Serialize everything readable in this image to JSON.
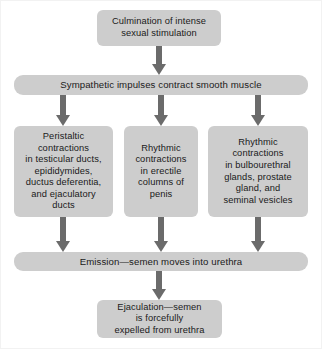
{
  "diagram": {
    "colors": {
      "box_fill": "#cdcdcd",
      "arrow": "#6b6b6b",
      "text": "#1a1a1a",
      "background": "#ffffff",
      "frame_border": "#f2f2f2"
    },
    "nodes": [
      {
        "id": "culmination",
        "label": "Culmination of intense sexual stimulation",
        "lines": [
          "Culmination of intense",
          "sexual stimulation"
        ],
        "stage": 1
      },
      {
        "id": "sympathetic",
        "label": "Sympathetic impulses contract smooth muscle",
        "lines": [
          "Sympathetic impulses contract smooth muscle"
        ],
        "stage": 2
      },
      {
        "id": "peristaltic",
        "label": "Peristaltic contractions in testicular ducts, epididymides, ductus deferentia, and ejaculatory ducts",
        "lines": [
          "Peristaltic",
          "contractions",
          "in testicular ducts,",
          "epididymides,",
          "ductus deferentia,",
          "and ejaculatory",
          "ducts"
        ],
        "stage": 3,
        "column": 1
      },
      {
        "id": "erectile",
        "label": "Rhythmic contractions in erectile columns of penis",
        "lines": [
          "Rhythmic",
          "contractions",
          "in erectile",
          "columns of",
          "penis"
        ],
        "stage": 3,
        "column": 2
      },
      {
        "id": "bulbourethral",
        "label": "Rhythmic contractions in bulbourethral glands, prostate gland, and seminal vesicles",
        "lines": [
          "Rhythmic",
          "contractions",
          "in bulbourethral",
          "glands, prostate",
          "gland, and",
          "seminal vesicles"
        ],
        "stage": 3,
        "column": 3
      },
      {
        "id": "emission",
        "label": "Emission—semen moves into urethra",
        "lines": [
          "Emission—semen moves into urethra"
        ],
        "stage": 4
      },
      {
        "id": "ejaculation",
        "label": "Ejaculation—semen is forcefully expelled from urethra",
        "lines": [
          "Ejaculation—semen",
          "is forcefully",
          "expelled from urethra"
        ],
        "stage": 5
      }
    ],
    "edges": [
      {
        "id": "culmination-to-sympathetic",
        "from": "culmination",
        "to": "sympathetic",
        "direction": "down"
      },
      {
        "id": "sympathetic-to-peristaltic",
        "from": "sympathetic",
        "to": "peristaltic",
        "direction": "down"
      },
      {
        "id": "sympathetic-to-erectile",
        "from": "sympathetic",
        "to": "erectile",
        "direction": "down"
      },
      {
        "id": "sympathetic-to-bulbourethral",
        "from": "sympathetic",
        "to": "bulbourethral",
        "direction": "down"
      },
      {
        "id": "peristaltic-to-emission",
        "from": "peristaltic",
        "to": "emission",
        "direction": "down"
      },
      {
        "id": "erectile-to-emission",
        "from": "erectile",
        "to": "emission",
        "direction": "down"
      },
      {
        "id": "bulbourethral-to-emission",
        "from": "bulbourethral",
        "to": "emission",
        "direction": "down"
      },
      {
        "id": "emission-to-ejaculation",
        "from": "emission",
        "to": "ejaculation",
        "direction": "down"
      }
    ],
    "node_text": {
      "culmination": "Culmination of intense\nsexual stimulation",
      "sympathetic": "Sympathetic impulses contract smooth muscle",
      "peristaltic": "Peristaltic\ncontractions\nin testicular ducts,\nepididymides,\nductus deferentia,\nand ejaculatory\nducts",
      "erectile": "Rhythmic\ncontractions\nin erectile\ncolumns of\npenis",
      "bulbourethral": "Rhythmic\ncontractions\nin bulbourethral\nglands, prostate\ngland, and\nseminal vesicles",
      "emission": "Emission—semen moves into urethra",
      "ejaculation": "Ejaculation—semen\nis forcefully\nexpelled from urethra"
    }
  }
}
